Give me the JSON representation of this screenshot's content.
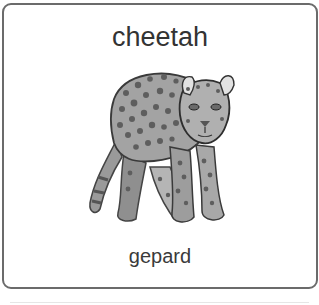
{
  "card": {
    "title": "cheetah",
    "image_icon": "cheetah-illustration",
    "translation": "gepard"
  },
  "colors": {
    "border": "#6b6b6b",
    "text": "#333333",
    "background": "#ffffff"
  }
}
